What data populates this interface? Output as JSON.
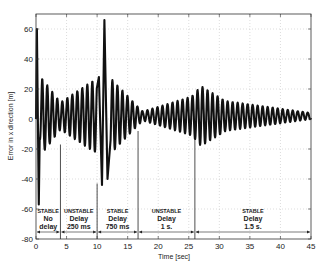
{
  "chart_data": {
    "type": "line",
    "title": "",
    "xlabel": "Time [sec]",
    "ylabel": "Error in x direction [m]",
    "xlim": [
      0,
      45
    ],
    "ylim": [
      -80,
      70
    ],
    "xticks": [
      0,
      5,
      10,
      15,
      20,
      25,
      30,
      35,
      40,
      45
    ],
    "yticks": [
      -80,
      -60,
      -40,
      -20,
      0,
      20,
      40,
      60
    ],
    "grid": true,
    "legend": null,
    "series": [
      {
        "name": "Error in x direction",
        "description": "oscillating error signal, approx. 1.2 Hz",
        "envelope": [
          {
            "t": 0.0,
            "amp": 0
          },
          {
            "t": 0.15,
            "peak": 60
          },
          {
            "t": 0.45,
            "peak": -57
          },
          {
            "t": 1.0,
            "amp": 25
          },
          {
            "t": 4.0,
            "amp": 9
          },
          {
            "t": 9.5,
            "amp": 24
          },
          {
            "t": 10.3,
            "peak": 28
          },
          {
            "t": 10.8,
            "peak": -44
          },
          {
            "t": 11.2,
            "peak": 66
          },
          {
            "t": 11.7,
            "peak": -40
          },
          {
            "t": 12.5,
            "amp": 24
          },
          {
            "t": 16.7,
            "amp": 6
          },
          {
            "t": 17.5,
            "amp": 3
          },
          {
            "t": 25.5,
            "amp": 13
          },
          {
            "t": 27.0,
            "amp": 20
          },
          {
            "t": 31.0,
            "amp": 10
          },
          {
            "t": 45.0,
            "amp": 2
          }
        ]
      }
    ],
    "annotations": {
      "dividers_t": [
        4.0,
        10.0,
        16.7,
        26.0
      ],
      "divider_tops": [
        -17,
        -43,
        -8,
        -6
      ],
      "regions": [
        {
          "state": "STABLE",
          "label1": "No",
          "label2": "delay",
          "t_start": 0,
          "t_end": 4.0
        },
        {
          "state": "UNSTABLE",
          "label1": "Delay",
          "label2": "250 ms",
          "t_start": 4.0,
          "t_end": 10.0
        },
        {
          "state": "STABLE",
          "label1": "Delay",
          "label2": "750 ms",
          "t_start": 10.0,
          "t_end": 16.7
        },
        {
          "state": "UNSTABLE",
          "label1": "Delay",
          "label2": "1 s.",
          "t_start": 16.7,
          "t_end": 26.0
        },
        {
          "state": "STABLE",
          "label1": "Delay",
          "label2": "1.5 s.",
          "t_start": 26.0,
          "t_end": 45
        }
      ]
    }
  }
}
